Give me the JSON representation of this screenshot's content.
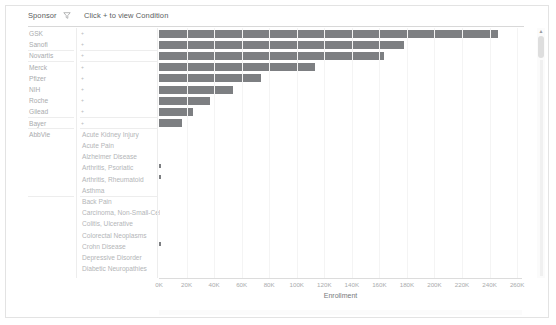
{
  "header": {
    "sponsor_label": "Sponsor",
    "filter_icon": "filter-icon",
    "condition_label": "Click + to view Condition"
  },
  "scrollbar": {
    "up_arrow_icon": "triangle-up-icon"
  },
  "chart_data": {
    "type": "bar",
    "orientation": "horizontal",
    "title": "",
    "xlabel": "Enrollment",
    "ylabel": "",
    "xlim": [
      0,
      265000
    ],
    "grid": true,
    "legend": null,
    "tick_labels": [
      "0K",
      "20K",
      "40K",
      "60K",
      "80K",
      "100K",
      "120K",
      "140K",
      "160K",
      "180K",
      "200K",
      "220K",
      "240K",
      "260K"
    ],
    "tick_values": [
      0,
      20000,
      40000,
      60000,
      80000,
      100000,
      120000,
      140000,
      160000,
      180000,
      200000,
      220000,
      240000,
      260000
    ],
    "bar_color": "#7d7f82",
    "categories": [
      "GSK",
      "Sanofi",
      "Novartis",
      "Merck",
      "Pfizer",
      "NIH",
      "Roche",
      "Gilead",
      "Bayer",
      "AbbVie"
    ],
    "values": [
      246000,
      178000,
      163000,
      113000,
      74000,
      54000,
      37000,
      25000,
      17000,
      0
    ]
  },
  "rows": [
    {
      "sponsor": "GSK",
      "condition": "",
      "plus": "+",
      "value": 246000
    },
    {
      "sponsor": "Sanofi",
      "condition": "",
      "plus": "+",
      "value": 178000
    },
    {
      "sponsor": "Novartis",
      "condition": "",
      "plus": "+",
      "value": 163000
    },
    {
      "sponsor": "Merck",
      "condition": "",
      "plus": "+",
      "value": 113000
    },
    {
      "sponsor": "Pfizer",
      "condition": "",
      "plus": "+",
      "value": 74000
    },
    {
      "sponsor": "NIH",
      "condition": "",
      "plus": "+",
      "value": 54000
    },
    {
      "sponsor": "Roche",
      "condition": "",
      "plus": "+",
      "value": 37000
    },
    {
      "sponsor": "Gilead",
      "condition": "",
      "plus": "+",
      "value": 25000
    },
    {
      "sponsor": "Bayer",
      "condition": "",
      "plus": "+",
      "value": 17000
    },
    {
      "sponsor": "AbbVie",
      "condition": "Acute Kidney Injury",
      "plus": "",
      "value": 0
    },
    {
      "sponsor": "",
      "condition": "Acute Pain",
      "plus": "",
      "value": 0
    },
    {
      "sponsor": "",
      "condition": "Alzheimer Disease",
      "plus": "",
      "value": 0
    },
    {
      "sponsor": "",
      "condition": "Arthritis, Psoriatic",
      "plus": "",
      "value": 700
    },
    {
      "sponsor": "",
      "condition": "Arthritis, Rheumatoid",
      "plus": "",
      "value": 1400
    },
    {
      "sponsor": "",
      "condition": "Asthma",
      "plus": "",
      "value": 0
    },
    {
      "sponsor": "",
      "condition": "Back Pain",
      "plus": "",
      "value": 0
    },
    {
      "sponsor": "",
      "condition": "Carcinoma, Non-Small-Cell",
      "plus": "",
      "value": 0
    },
    {
      "sponsor": "",
      "condition": "Colitis, Ulcerative",
      "plus": "",
      "value": 0
    },
    {
      "sponsor": "",
      "condition": "Colorectal Neoplasms",
      "plus": "",
      "value": 0
    },
    {
      "sponsor": "",
      "condition": "Crohn Disease",
      "plus": "",
      "value": 900
    },
    {
      "sponsor": "",
      "condition": "Depressive Disorder",
      "plus": "",
      "value": 0
    },
    {
      "sponsor": "",
      "condition": "Diabetic Neuropathies",
      "plus": "",
      "value": 0
    }
  ]
}
